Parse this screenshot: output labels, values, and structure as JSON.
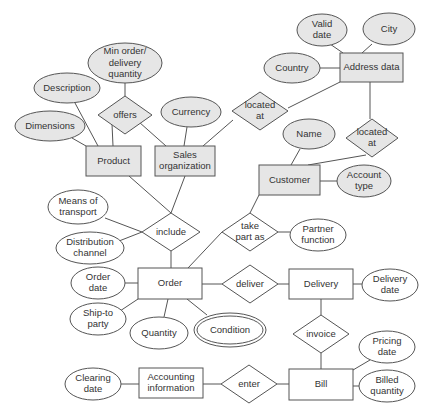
{
  "diagram": {
    "type": "entity-relationship",
    "colors": {
      "shaded_fill": "#e6e6e6",
      "plain_fill": "#ffffff",
      "stroke": "#555555",
      "text": "#333333"
    },
    "entities": [
      {
        "id": "product",
        "label": "Product",
        "x": 86,
        "y": 146,
        "w": 55,
        "h": 30,
        "shaded": true
      },
      {
        "id": "sales_org",
        "label": [
          "Sales",
          "organization"
        ],
        "x": 155,
        "y": 146,
        "w": 60,
        "h": 30,
        "shaded": true
      },
      {
        "id": "address_data",
        "label": "Address data",
        "x": 340,
        "y": 53,
        "w": 63,
        "h": 29,
        "shaded": true
      },
      {
        "id": "customer",
        "label": "Customer",
        "x": 259,
        "y": 165,
        "w": 61,
        "h": 30,
        "shaded": true
      },
      {
        "id": "order",
        "label": "Order",
        "x": 138,
        "y": 268,
        "w": 64,
        "h": 31,
        "shaded": false
      },
      {
        "id": "delivery",
        "label": "Delivery",
        "x": 289,
        "y": 269,
        "w": 64,
        "h": 30,
        "shaded": false
      },
      {
        "id": "bill",
        "label": "Bill",
        "x": 289,
        "y": 369,
        "w": 64,
        "h": 31,
        "shaded": false
      },
      {
        "id": "accounting_info",
        "label": [
          "Accounting",
          "information"
        ],
        "x": 139,
        "y": 368,
        "w": 64,
        "h": 30,
        "shaded": false
      }
    ],
    "relationships": [
      {
        "id": "offers",
        "label": "offers",
        "cx": 125,
        "cy": 115,
        "hw": 27,
        "hh": 19,
        "shaded": true
      },
      {
        "id": "located_at_1",
        "label": [
          "located",
          "at"
        ],
        "cx": 260,
        "cy": 111,
        "hw": 28,
        "hh": 19,
        "shaded": true
      },
      {
        "id": "located_at_2",
        "label": [
          "located",
          "at"
        ],
        "cx": 372,
        "cy": 138,
        "hw": 26,
        "hh": 19,
        "shaded": true
      },
      {
        "id": "include",
        "label": "include",
        "cx": 171,
        "cy": 232,
        "hw": 29,
        "hh": 19,
        "shaded": false
      },
      {
        "id": "take_part_as",
        "label": [
          "take",
          "part as"
        ],
        "cx": 250,
        "cy": 232,
        "hw": 28,
        "hh": 19,
        "shaded": false
      },
      {
        "id": "deliver",
        "label": "deliver",
        "cx": 250,
        "cy": 284,
        "hw": 28,
        "hh": 19,
        "shaded": false
      },
      {
        "id": "invoice",
        "label": "invoice",
        "cx": 321,
        "cy": 334,
        "hw": 28,
        "hh": 19,
        "shaded": false
      },
      {
        "id": "enter",
        "label": "enter",
        "cx": 249,
        "cy": 384,
        "hw": 28,
        "hh": 19,
        "shaded": false
      }
    ],
    "attributes": [
      {
        "id": "min_order",
        "label": [
          "Min order/",
          "delivery",
          "quantity"
        ],
        "cx": 125,
        "cy": 63,
        "rx": 37,
        "ry": 20,
        "shaded": true
      },
      {
        "id": "description",
        "label": "Description",
        "cx": 67,
        "cy": 88,
        "rx": 33,
        "ry": 15,
        "shaded": true
      },
      {
        "id": "dimensions",
        "label": "Dimensions",
        "cx": 50,
        "cy": 126,
        "rx": 35,
        "ry": 15,
        "shaded": true
      },
      {
        "id": "currency",
        "label": "Currency",
        "cx": 191,
        "cy": 112,
        "rx": 30,
        "ry": 15,
        "shaded": true
      },
      {
        "id": "valid_date",
        "label": [
          "Valid",
          "date"
        ],
        "cx": 322,
        "cy": 30,
        "rx": 25,
        "ry": 16,
        "shaded": true
      },
      {
        "id": "city",
        "label": "City",
        "cx": 389,
        "cy": 29,
        "rx": 26,
        "ry": 16,
        "shaded": true
      },
      {
        "id": "country",
        "label": "Country",
        "cx": 292,
        "cy": 68,
        "rx": 28,
        "ry": 15,
        "shaded": true
      },
      {
        "id": "name",
        "label": "Name",
        "cx": 309,
        "cy": 134,
        "rx": 26,
        "ry": 15,
        "shaded": true
      },
      {
        "id": "account_type",
        "label": [
          "Account",
          "type"
        ],
        "cx": 364,
        "cy": 181,
        "rx": 27,
        "ry": 16,
        "shaded": true
      },
      {
        "id": "means_of_transport",
        "label": [
          "Means of",
          "transport"
        ],
        "cx": 78,
        "cy": 207,
        "rx": 30,
        "ry": 17,
        "shaded": false
      },
      {
        "id": "distribution_channel",
        "label": [
          "Distribution",
          "channel"
        ],
        "cx": 90,
        "cy": 248,
        "rx": 34,
        "ry": 16,
        "shaded": false
      },
      {
        "id": "order_date",
        "label": [
          "Order",
          "date"
        ],
        "cx": 98,
        "cy": 283,
        "rx": 27,
        "ry": 16,
        "shaded": false
      },
      {
        "id": "ship_to_party",
        "label": [
          "Ship-to",
          "party"
        ],
        "cx": 98,
        "cy": 319,
        "rx": 28,
        "ry": 16,
        "shaded": false
      },
      {
        "id": "quantity",
        "label": "Quantity",
        "cx": 159,
        "cy": 333,
        "rx": 29,
        "ry": 16,
        "shaded": false
      },
      {
        "id": "condition",
        "label": "Condition",
        "cx": 230,
        "cy": 330,
        "rx": 36,
        "ry": 17,
        "shaded": false,
        "double": true
      },
      {
        "id": "partner_function",
        "label": [
          "Partner",
          "function"
        ],
        "cx": 318,
        "cy": 235,
        "rx": 28,
        "ry": 16,
        "shaded": false
      },
      {
        "id": "delivery_date",
        "label": [
          "Delivery",
          "date"
        ],
        "cx": 390,
        "cy": 285,
        "rx": 28,
        "ry": 16,
        "shaded": false
      },
      {
        "id": "pricing_date",
        "label": [
          "Pricing",
          "date"
        ],
        "cx": 387,
        "cy": 347,
        "rx": 28,
        "ry": 16,
        "shaded": false
      },
      {
        "id": "billed_quantity",
        "label": [
          "Billed",
          "quantity"
        ],
        "cx": 387,
        "cy": 386,
        "rx": 28,
        "ry": 16,
        "shaded": false
      },
      {
        "id": "clearing_date",
        "label": [
          "Clearing",
          "date"
        ],
        "cx": 93,
        "cy": 384,
        "rx": 28,
        "ry": 16,
        "shaded": false
      }
    ],
    "connections": [
      [
        125,
        83,
        125,
        96
      ],
      [
        112,
        124,
        113,
        146
      ],
      [
        139,
        122,
        166,
        146
      ],
      [
        75,
        103,
        98,
        146
      ],
      [
        72,
        138,
        86,
        146
      ],
      [
        187,
        127,
        184,
        146
      ],
      [
        203,
        146,
        233,
        120
      ],
      [
        288,
        108,
        340,
        82
      ],
      [
        330,
        44,
        343,
        53
      ],
      [
        372,
        44,
        362,
        53
      ],
      [
        320,
        68,
        340,
        68
      ],
      [
        370,
        82,
        370,
        119
      ],
      [
        366,
        155,
        308,
        165
      ],
      [
        300,
        149,
        291,
        165
      ],
      [
        320,
        181,
        337,
        181
      ],
      [
        129,
        176,
        171,
        213
      ],
      [
        185,
        176,
        171,
        213
      ],
      [
        105,
        218,
        142,
        232
      ],
      [
        119,
        241,
        142,
        232
      ],
      [
        171,
        251,
        171,
        268
      ],
      [
        125,
        283,
        138,
        283
      ],
      [
        120,
        311,
        138,
        299
      ],
      [
        168,
        299,
        164,
        317
      ],
      [
        187,
        299,
        207,
        315
      ],
      [
        188,
        268,
        222,
        232
      ],
      [
        278,
        232,
        290,
        232
      ],
      [
        250,
        213,
        259,
        195
      ],
      [
        202,
        284,
        222,
        284
      ],
      [
        278,
        284,
        289,
        284
      ],
      [
        353,
        284,
        362,
        284
      ],
      [
        321,
        299,
        321,
        315
      ],
      [
        321,
        353,
        321,
        369
      ],
      [
        353,
        370,
        370,
        360
      ],
      [
        353,
        386,
        359,
        386
      ],
      [
        121,
        384,
        139,
        384
      ],
      [
        203,
        384,
        221,
        384
      ],
      [
        277,
        384,
        289,
        384
      ]
    ]
  }
}
